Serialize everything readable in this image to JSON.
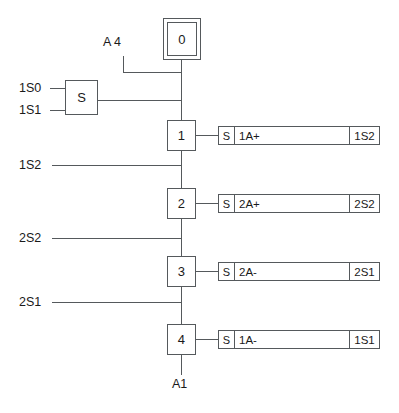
{
  "diagram": {
    "type": "sequential-function-chart",
    "title_visible": false
  },
  "initial_step": {
    "number": "0"
  },
  "start_logic": {
    "block_label": "S",
    "inputs": [
      "1S0",
      "1S1"
    ],
    "extra_condition": "A 4"
  },
  "steps": [
    {
      "number": "1",
      "action": {
        "qualifier": "S",
        "description": "1A+",
        "feedback": "1S2"
      },
      "transition_below": "1S2"
    },
    {
      "number": "2",
      "action": {
        "qualifier": "S",
        "description": "2A+",
        "feedback": "2S2"
      },
      "transition_below": "2S2"
    },
    {
      "number": "3",
      "action": {
        "qualifier": "S",
        "description": "2A-",
        "feedback": "2S1"
      },
      "transition_below": "2S1"
    },
    {
      "number": "4",
      "action": {
        "qualifier": "S",
        "description": "1A-",
        "feedback": "1S1"
      },
      "transition_below": ""
    }
  ],
  "output_label": "A1",
  "colors": {
    "line": "#55595c",
    "text": "#1a1a1a",
    "background": "#ffffff"
  }
}
